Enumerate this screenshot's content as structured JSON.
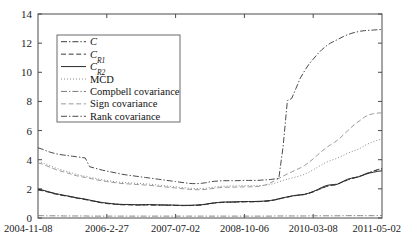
{
  "chart_data": {
    "type": "line",
    "title": "",
    "xlabel": "",
    "ylabel": "",
    "ylim": [
      0,
      14
    ],
    "yticks": [
      0,
      2,
      4,
      6,
      8,
      10,
      12,
      14
    ],
    "grid": false,
    "legend_position": "upper-left",
    "xticklabels": [
      "2004-11-08",
      "2006-2-27",
      "2007-07-02",
      "2008-10-06",
      "2010-03-08",
      "2011-05-02"
    ],
    "x": [
      0,
      1,
      2,
      3,
      4,
      5,
      6,
      7,
      8,
      9,
      10,
      11,
      12,
      13,
      14,
      15,
      16,
      17,
      18,
      19,
      20,
      21,
      22,
      23,
      24,
      25,
      26,
      27,
      28,
      29,
      30,
      31,
      32,
      33,
      34,
      35,
      36,
      37,
      38,
      39,
      40,
      41,
      42,
      43,
      44,
      45,
      46,
      47,
      48,
      49,
      50,
      51,
      52,
      53,
      54,
      55,
      56,
      57,
      58,
      59,
      60,
      61,
      62,
      63,
      64,
      65,
      66,
      67,
      68,
      69,
      70,
      71,
      72,
      73,
      74,
      75,
      76,
      77,
      78,
      79,
      80
    ],
    "series": [
      {
        "name": "C",
        "style": "dashdot",
        "color": "#3a3a3a",
        "width": 0.9,
        "values": [
          1.95,
          1.9,
          1.82,
          1.74,
          1.66,
          1.6,
          1.55,
          1.5,
          1.44,
          1.38,
          1.33,
          1.28,
          1.22,
          1.16,
          1.1,
          1.05,
          1.01,
          0.98,
          0.95,
          0.93,
          0.92,
          0.92,
          0.91,
          0.9,
          0.9,
          0.91,
          0.91,
          0.9,
          0.89,
          0.89,
          0.88,
          0.88,
          0.87,
          0.86,
          0.86,
          0.86,
          0.87,
          0.88,
          0.9,
          0.94,
          0.99,
          1.03,
          1.06,
          1.08,
          1.09,
          1.09,
          1.1,
          1.11,
          1.12,
          1.12,
          1.12,
          1.13,
          1.14,
          1.16,
          1.19,
          1.24,
          1.31,
          1.38,
          1.44,
          1.5,
          1.55,
          1.58,
          1.62,
          1.7,
          1.8,
          1.92,
          2.05,
          2.16,
          2.24,
          2.3,
          2.38,
          2.5,
          2.62,
          2.72,
          2.8,
          2.9,
          3.02,
          3.12,
          3.22,
          3.32,
          3.4
        ]
      },
      {
        "name": "C_R1",
        "style": "dashed",
        "color": "#3a3a3a",
        "width": 0.9,
        "values": [
          1.92,
          1.87,
          1.8,
          1.72,
          1.64,
          1.58,
          1.53,
          1.48,
          1.42,
          1.36,
          1.31,
          1.26,
          1.2,
          1.14,
          1.08,
          1.03,
          0.99,
          0.96,
          0.93,
          0.91,
          0.9,
          0.9,
          0.89,
          0.88,
          0.88,
          0.89,
          0.89,
          0.88,
          0.88,
          0.88,
          0.87,
          0.87,
          0.86,
          0.85,
          0.85,
          0.85,
          0.86,
          0.87,
          0.89,
          0.93,
          0.98,
          1.02,
          1.05,
          1.07,
          1.08,
          1.08,
          1.09,
          1.1,
          1.11,
          1.11,
          1.11,
          1.12,
          1.13,
          1.15,
          1.18,
          1.23,
          1.3,
          1.37,
          1.43,
          1.49,
          1.54,
          1.57,
          1.61,
          1.69,
          1.79,
          1.91,
          2.04,
          2.15,
          2.23,
          2.29,
          2.37,
          2.49,
          2.61,
          2.71,
          2.79,
          2.89,
          3.01,
          3.11,
          3.21,
          3.31,
          3.38
        ]
      },
      {
        "name": "C_R2",
        "style": "solid",
        "color": "#2a2a2a",
        "width": 1.0,
        "values": [
          1.98,
          1.92,
          1.84,
          1.76,
          1.68,
          1.62,
          1.56,
          1.51,
          1.45,
          1.39,
          1.34,
          1.29,
          1.23,
          1.17,
          1.11,
          1.06,
          1.02,
          0.99,
          0.96,
          0.94,
          0.93,
          0.93,
          0.92,
          0.91,
          0.91,
          0.92,
          0.92,
          0.91,
          0.9,
          0.9,
          0.89,
          0.89,
          0.88,
          0.87,
          0.87,
          0.87,
          0.88,
          0.89,
          0.91,
          0.95,
          1.0,
          1.04,
          1.07,
          1.09,
          1.1,
          1.1,
          1.11,
          1.12,
          1.13,
          1.13,
          1.13,
          1.14,
          1.15,
          1.17,
          1.2,
          1.25,
          1.32,
          1.39,
          1.45,
          1.51,
          1.56,
          1.59,
          1.63,
          1.71,
          1.82,
          1.95,
          2.1,
          2.22,
          2.28,
          2.26,
          2.36,
          2.52,
          2.66,
          2.74,
          2.78,
          2.86,
          2.98,
          3.08,
          3.14,
          3.2,
          3.24
        ]
      },
      {
        "name": "MCD",
        "style": "dotted",
        "color": "#8a8a8a",
        "width": 1.0,
        "values": [
          3.9,
          3.8,
          3.68,
          3.56,
          3.44,
          3.34,
          3.26,
          3.18,
          3.08,
          2.99,
          2.92,
          2.86,
          2.8,
          2.74,
          2.68,
          2.62,
          2.57,
          2.53,
          2.49,
          2.46,
          2.44,
          2.42,
          2.4,
          2.38,
          2.36,
          2.34,
          2.32,
          2.29,
          2.26,
          2.23,
          2.2,
          2.17,
          2.14,
          2.11,
          2.08,
          2.05,
          2.03,
          2.02,
          2.02,
          2.04,
          2.08,
          2.12,
          2.16,
          2.18,
          2.19,
          2.2,
          2.2,
          2.21,
          2.22,
          2.22,
          2.22,
          2.22,
          2.23,
          2.25,
          2.3,
          2.38,
          2.48,
          2.58,
          2.66,
          2.74,
          2.82,
          2.9,
          3.0,
          3.14,
          3.3,
          3.48,
          3.66,
          3.82,
          3.94,
          4.04,
          4.16,
          4.3,
          4.44,
          4.56,
          4.66,
          4.8,
          4.98,
          5.12,
          5.24,
          5.34,
          5.42
        ]
      },
      {
        "name": "Compbell covariance",
        "style": "dashdot",
        "color": "#7a7a7a",
        "width": 0.9,
        "values": [
          0.16,
          0.16,
          0.15,
          0.15,
          0.15,
          0.15,
          0.14,
          0.14,
          0.14,
          0.14,
          0.14,
          0.14,
          0.13,
          0.13,
          0.13,
          0.13,
          0.13,
          0.13,
          0.13,
          0.13,
          0.13,
          0.13,
          0.13,
          0.13,
          0.13,
          0.13,
          0.13,
          0.13,
          0.13,
          0.13,
          0.13,
          0.13,
          0.13,
          0.13,
          0.13,
          0.13,
          0.13,
          0.13,
          0.13,
          0.13,
          0.13,
          0.13,
          0.13,
          0.13,
          0.13,
          0.13,
          0.13,
          0.13,
          0.13,
          0.13,
          0.13,
          0.13,
          0.13,
          0.13,
          0.13,
          0.14,
          0.14,
          0.14,
          0.14,
          0.14,
          0.14,
          0.14,
          0.14,
          0.15,
          0.15,
          0.15,
          0.15,
          0.15,
          0.15,
          0.15,
          0.15,
          0.16,
          0.16,
          0.16,
          0.16,
          0.16,
          0.16,
          0.16,
          0.16,
          0.17,
          0.17
        ]
      },
      {
        "name": "Sign covariance",
        "style": "dashed",
        "color": "#9a9a9a",
        "width": 1.0,
        "values": [
          3.78,
          3.7,
          3.58,
          3.46,
          3.34,
          3.24,
          3.16,
          3.08,
          2.98,
          2.9,
          2.84,
          2.78,
          2.72,
          2.66,
          2.6,
          2.55,
          2.5,
          2.46,
          2.42,
          2.38,
          2.36,
          2.34,
          2.32,
          2.3,
          2.28,
          2.26,
          2.24,
          2.21,
          2.18,
          2.15,
          2.12,
          2.09,
          2.06,
          2.03,
          2.0,
          1.97,
          1.95,
          1.94,
          1.94,
          1.96,
          2.0,
          2.04,
          2.08,
          2.1,
          2.11,
          2.12,
          2.12,
          2.13,
          2.14,
          2.14,
          2.14,
          2.16,
          2.2,
          2.28,
          2.4,
          2.55,
          2.72,
          2.88,
          3.02,
          3.16,
          3.3,
          3.44,
          3.6,
          3.82,
          4.06,
          4.32,
          4.58,
          4.82,
          5.02,
          5.2,
          5.42,
          5.7,
          5.98,
          6.26,
          6.5,
          6.72,
          6.94,
          7.08,
          7.16,
          7.2,
          7.22
        ]
      },
      {
        "name": "Rank covariance",
        "style": "dashdot",
        "color": "#4a4a4a",
        "width": 1.0,
        "values": [
          4.82,
          4.72,
          4.6,
          4.5,
          4.42,
          4.36,
          4.32,
          4.28,
          4.24,
          4.2,
          4.16,
          4.12,
          3.52,
          3.44,
          3.36,
          3.28,
          3.22,
          3.16,
          3.1,
          3.04,
          2.98,
          2.94,
          2.9,
          2.86,
          2.82,
          2.78,
          2.74,
          2.7,
          2.66,
          2.62,
          2.58,
          2.54,
          2.5,
          2.46,
          2.42,
          2.38,
          2.36,
          2.36,
          2.38,
          2.42,
          2.48,
          2.52,
          2.54,
          2.56,
          2.56,
          2.56,
          2.56,
          2.57,
          2.58,
          2.58,
          2.58,
          2.58,
          2.6,
          2.62,
          2.64,
          2.68,
          2.72,
          4.9,
          8.05,
          8.2,
          8.9,
          9.6,
          10.1,
          10.55,
          10.9,
          11.25,
          11.55,
          11.8,
          12.0,
          12.15,
          12.3,
          12.45,
          12.58,
          12.68,
          12.76,
          12.82,
          12.86,
          12.88,
          12.9,
          12.92,
          12.94
        ]
      }
    ]
  },
  "legend": {
    "items": [
      {
        "label": "C",
        "sub": "",
        "style": "dashdot",
        "color": "#3a3a3a",
        "italic": true
      },
      {
        "label": "C",
        "sub": "R1",
        "style": "dashed",
        "color": "#3a3a3a",
        "italic": true
      },
      {
        "label": "C",
        "sub": "R2",
        "style": "solid",
        "color": "#2a2a2a",
        "italic": true
      },
      {
        "label": "MCD",
        "sub": "",
        "style": "dotted",
        "color": "#8a8a8a",
        "italic": false
      },
      {
        "label": "Compbell covariance",
        "sub": "",
        "style": "dashdot",
        "color": "#7a7a7a",
        "italic": false
      },
      {
        "label": "Sign covariance",
        "sub": "",
        "style": "dashed",
        "color": "#9a9a9a",
        "italic": false
      },
      {
        "label": "Rank covariance",
        "sub": "",
        "style": "dashdot",
        "color": "#4a4a4a",
        "italic": false
      }
    ]
  }
}
